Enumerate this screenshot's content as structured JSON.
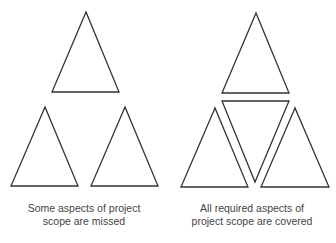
{
  "diagram": {
    "stroke_color": "#333333",
    "background": "#ffffff",
    "panels": [
      {
        "id": "missed",
        "caption_lines": [
          "Some aspects of project",
          "scope are missed"
        ],
        "triangles": [
          {
            "points": "86,12 52,92 119,92"
          },
          {
            "points": "45,107 11,186 78,186"
          },
          {
            "points": "125,107 91,186 158,186"
          }
        ]
      },
      {
        "id": "covered",
        "caption_lines": [
          "All required aspects of",
          "project scope are covered"
        ],
        "triangles": [
          {
            "points": "256,13 222,93 289,93"
          },
          {
            "points": "222,101 289,101 255,182"
          },
          {
            "points": "215,108 181,187 248,187"
          },
          {
            "points": "295,108 261,187 329,187"
          }
        ]
      }
    ]
  }
}
